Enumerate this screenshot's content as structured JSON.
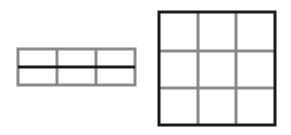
{
  "diagram": {
    "colors": {
      "background": "#ffffff",
      "thin_line": "#8a8a8a",
      "bold_line": "#1a1a1a"
    },
    "left_grid": {
      "columns": 3,
      "rows": 2,
      "x": 18,
      "y": 49,
      "width": 117,
      "height": 36,
      "col_dividers": [
        57,
        96
      ],
      "bold_midline_y": 67
    },
    "right_grid": {
      "columns": 3,
      "rows": 3,
      "x": 159,
      "y": 12,
      "width": 116,
      "height": 113,
      "col_dividers": [
        198,
        236
      ],
      "row_dividers": [
        51,
        88
      ]
    }
  }
}
